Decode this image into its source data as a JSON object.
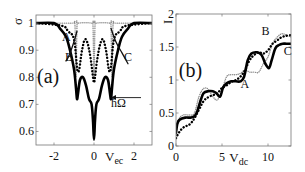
{
  "chart_data": [
    {
      "panel": "(a)",
      "type": "line",
      "title": "",
      "xlabel": "V_ec",
      "ylabel": "σ",
      "xlim": [
        -2.9,
        2.9
      ],
      "ylim": [
        0.55,
        1.03
      ],
      "xticks": [
        -2,
        0,
        2
      ],
      "xtick_labels": [
        "-2",
        "0",
        "2"
      ],
      "yticks": [
        0.6,
        0.7,
        0.8,
        0.9,
        1
      ],
      "ytick_labels": [
        "0.6",
        "0.7",
        "0.8",
        "0.9",
        "1"
      ],
      "grid": false,
      "legend": null,
      "annotations": [
        {
          "text": "(a)",
          "x": -2.85,
          "y": 0.78
        },
        {
          "text": "A",
          "x": -1.6,
          "y": 0.935
        },
        {
          "text": "B",
          "x": -1.45,
          "y": 0.86
        },
        {
          "text": "C",
          "x": 1.5,
          "y": 0.86
        },
        {
          "text": "ħΩ",
          "x": 0.85,
          "y": 0.69
        },
        {
          "text": "arrow",
          "x": 0.85,
          "y": 0.725
        }
      ],
      "series": [
        {
          "name": "A (dotted grey)",
          "style": "dotted-grey",
          "x": [
            -2.9,
            -1.2,
            -1.0,
            -0.95,
            -0.9,
            -0.85,
            -0.8,
            -0.1,
            -0.05,
            0,
            0.05,
            0.1,
            0.8,
            0.85,
            0.9,
            0.95,
            1.0,
            1.2,
            2.9
          ],
          "y": [
            1.0,
            1.0,
            1.0,
            0.99,
            0.8,
            0.99,
            1.0,
            1.0,
            0.99,
            0.8,
            0.99,
            1.0,
            1.0,
            0.99,
            0.8,
            0.99,
            1.0,
            1.0,
            1.0
          ]
        },
        {
          "name": "B (dotted black)",
          "style": "dotted-black",
          "x": [
            -2.9,
            -1.6,
            -1.3,
            -1.0,
            -0.8,
            -0.6,
            -0.45,
            -0.3,
            -0.15,
            -0.05,
            0,
            0.05,
            0.15,
            0.3,
            0.45,
            0.6,
            0.8,
            1.0,
            1.3,
            1.6,
            2.9
          ],
          "y": [
            1.0,
            0.99,
            0.97,
            0.94,
            0.82,
            0.9,
            0.94,
            0.92,
            0.86,
            0.8,
            0.78,
            0.8,
            0.86,
            0.92,
            0.94,
            0.9,
            0.82,
            0.94,
            0.97,
            0.99,
            1.0
          ]
        },
        {
          "name": "C (solid black)",
          "style": "solid-black",
          "x": [
            -2.9,
            -2.0,
            -1.7,
            -1.4,
            -1.2,
            -1.0,
            -0.9,
            -0.85,
            -0.8,
            -0.7,
            -0.55,
            -0.4,
            -0.25,
            -0.12,
            -0.05,
            0,
            0.05,
            0.12,
            0.25,
            0.4,
            0.55,
            0.7,
            0.8,
            0.85,
            0.9,
            1.0,
            1.2,
            1.4,
            1.7,
            2.0,
            2.9
          ],
          "y": [
            1.0,
            1.0,
            0.98,
            0.95,
            0.9,
            0.83,
            0.76,
            0.72,
            0.74,
            0.79,
            0.8,
            0.77,
            0.72,
            0.7,
            0.64,
            0.57,
            0.64,
            0.7,
            0.72,
            0.77,
            0.8,
            0.79,
            0.74,
            0.72,
            0.76,
            0.83,
            0.9,
            0.95,
            0.98,
            1.0,
            1.0
          ]
        },
        {
          "name": "crossing solid (to C label)",
          "style": "solid-black-thin",
          "x": [
            0.85,
            1.1,
            1.4,
            1.7
          ],
          "y": [
            0.98,
            0.93,
            0.89,
            0.85
          ]
        },
        {
          "name": "crossing solid (to B label)",
          "style": "solid-black-thin",
          "x": [
            -0.85,
            -1.05,
            -1.25,
            -1.4
          ],
          "y": [
            0.97,
            0.92,
            0.88,
            0.86
          ]
        }
      ]
    },
    {
      "panel": "(b)",
      "type": "line",
      "title": "",
      "xlabel": "V_dc",
      "ylabel": "I",
      "xlim": [
        0,
        12.5
      ],
      "ylim": [
        0,
        2
      ],
      "xticks": [
        0,
        5,
        10
      ],
      "xtick_labels": [
        "0",
        "5",
        "10"
      ],
      "yticks": [
        0,
        0.5,
        1,
        1.5,
        2
      ],
      "ytick_labels": [
        "0",
        "0.5",
        "1",
        "1.5",
        "2"
      ],
      "grid": false,
      "legend": null,
      "annotations": [
        {
          "text": "(b)",
          "x": 0.3,
          "y": 1.05
        },
        {
          "text": "A",
          "x": 7.0,
          "y": 0.88
        },
        {
          "text": "B",
          "x": 9.3,
          "y": 1.68
        },
        {
          "text": "C",
          "x": 11.7,
          "y": 1.38
        }
      ],
      "series": [
        {
          "name": "A (dotted grey)",
          "style": "dotted-grey",
          "x": [
            0,
            0.3,
            0.8,
            1.5,
            2.0,
            2.5,
            3.0,
            3.5,
            4.0,
            4.5,
            5.0,
            5.5,
            6.0,
            6.5,
            7.0,
            7.5,
            8.0,
            8.5,
            9.0,
            9.5,
            10.0,
            10.5,
            11.0,
            11.5,
            12.0,
            12.5
          ],
          "y": [
            0.2,
            0.4,
            0.47,
            0.47,
            0.5,
            0.75,
            0.87,
            0.86,
            0.75,
            0.7,
            0.85,
            1.05,
            1.08,
            1.08,
            1.1,
            1.15,
            1.12,
            1.12,
            1.12,
            1.25,
            1.35,
            1.55,
            1.65,
            1.7,
            1.68,
            1.65
          ]
        },
        {
          "name": "B (dotted black)",
          "style": "dotted-black",
          "x": [
            0,
            0.3,
            0.8,
            1.5,
            2.0,
            2.5,
            3.0,
            3.5,
            4.0,
            4.5,
            5.0,
            5.5,
            6.0,
            6.5,
            7.0,
            7.5,
            8.0,
            8.5,
            9.0,
            9.5,
            10.0,
            10.5,
            11.0,
            11.5,
            12.0,
            12.5
          ],
          "y": [
            0.12,
            0.2,
            0.28,
            0.33,
            0.42,
            0.55,
            0.68,
            0.74,
            0.77,
            0.8,
            0.88,
            0.92,
            0.97,
            1.0,
            1.05,
            1.15,
            1.3,
            1.38,
            1.42,
            1.4,
            1.45,
            1.55,
            1.6,
            1.65,
            1.67,
            1.68
          ]
        },
        {
          "name": "C (solid black)",
          "style": "solid-black",
          "x": [
            0,
            0.15,
            0.4,
            1.0,
            1.6,
            2.0,
            2.3,
            2.7,
            3.0,
            3.5,
            4.0,
            4.4,
            4.8,
            5.1,
            5.5,
            6.0,
            6.5,
            7.0,
            7.4,
            7.8,
            8.2,
            8.8,
            9.3,
            9.7,
            10.1,
            10.4,
            10.8,
            11.2,
            11.6,
            12.0,
            12.5
          ],
          "y": [
            0.2,
            0.34,
            0.4,
            0.43,
            0.43,
            0.45,
            0.52,
            0.7,
            0.8,
            0.83,
            0.83,
            0.8,
            0.75,
            0.88,
            0.95,
            0.98,
            0.98,
            0.98,
            1.05,
            1.3,
            1.4,
            1.42,
            1.38,
            1.25,
            1.18,
            1.3,
            1.48,
            1.53,
            1.55,
            1.55,
            1.55
          ]
        }
      ]
    }
  ]
}
